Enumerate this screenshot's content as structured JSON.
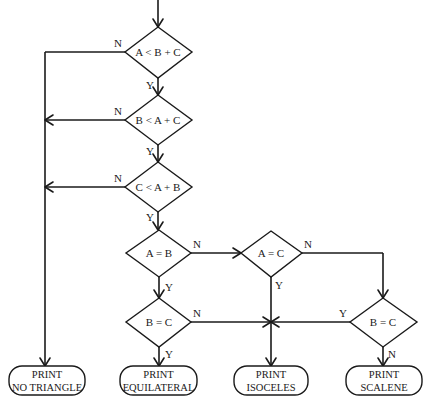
{
  "diagram": {
    "type": "flowchart",
    "title": "",
    "decisions": [
      {
        "id": "d1",
        "text": "A < B + C",
        "yes": "d2",
        "no": "t_no_triangle"
      },
      {
        "id": "d2",
        "text": "B < A + C",
        "yes": "d3",
        "no": "t_no_triangle"
      },
      {
        "id": "d3",
        "text": "C < A + B",
        "yes": "d4",
        "no": "t_no_triangle"
      },
      {
        "id": "d4",
        "text": "A = B",
        "yes": "d5",
        "no": "d6"
      },
      {
        "id": "d5",
        "text": "B = C",
        "yes": "t_equilateral",
        "no": "t_isoceles"
      },
      {
        "id": "d6",
        "text": "A = C",
        "yes": "t_isoceles",
        "no": "d7"
      },
      {
        "id": "d7",
        "text": "B = C",
        "yes": "t_isoceles",
        "no": "t_scalene"
      }
    ],
    "terminals": [
      {
        "id": "t_no_triangle",
        "line1": "PRINT",
        "line2": "NO TRIANGLE"
      },
      {
        "id": "t_equilateral",
        "line1": "PRINT",
        "line2": "EQUILATERAL"
      },
      {
        "id": "t_isoceles",
        "line1": "PRINT",
        "line2": "ISOCELES"
      },
      {
        "id": "t_scalene",
        "line1": "PRINT",
        "line2": "SCALENE"
      }
    ],
    "branch_labels": {
      "yes": "Y",
      "no": "N"
    }
  }
}
